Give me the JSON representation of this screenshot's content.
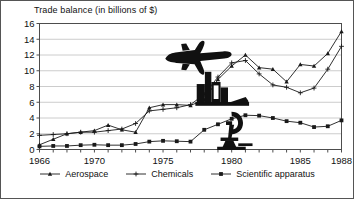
{
  "chart_data": {
    "type": "line",
    "title": "Trade balance (in billions of $)",
    "xlabel": "",
    "ylabel": "",
    "xlim": [
      1966,
      1988
    ],
    "ylim": [
      0,
      16
    ],
    "ytick_labels": [
      "0",
      "2",
      "4",
      "6",
      "8",
      "10",
      "12",
      "14",
      "16"
    ],
    "yticks": [
      0,
      2,
      4,
      6,
      8,
      10,
      12,
      14,
      16
    ],
    "xtick_labels": [
      "1966",
      "1970",
      "1975",
      "1980",
      "1985",
      "1988"
    ],
    "xticks": [
      1966,
      1970,
      1975,
      1980,
      1985,
      1988
    ],
    "grid": "horizontal",
    "legend_position": "bottom",
    "x": [
      1966,
      1967,
      1968,
      1969,
      1970,
      1971,
      1972,
      1973,
      1974,
      1975,
      1976,
      1977,
      1978,
      1979,
      1980,
      1981,
      1982,
      1983,
      1984,
      1985,
      1986,
      1987,
      1988
    ],
    "series": [
      {
        "name": "Aerospace",
        "marker": "triangle",
        "values": [
          0.6,
          1.3,
          2.0,
          2.2,
          2.4,
          3.1,
          2.5,
          2.2,
          5.3,
          5.7,
          5.7,
          5.6,
          6.3,
          8.9,
          10.6,
          12.0,
          10.4,
          10.2,
          8.6,
          10.8,
          10.6,
          12.2,
          15.0
        ]
      },
      {
        "name": "Chemicals",
        "marker": "plus",
        "values": [
          1.8,
          1.9,
          2.0,
          2.2,
          2.2,
          2.4,
          2.6,
          3.3,
          4.9,
          5.1,
          5.3,
          5.7,
          7.0,
          9.2,
          11.0,
          11.3,
          9.6,
          8.2,
          7.9,
          7.2,
          7.8,
          10.2,
          13.1
        ]
      },
      {
        "name": "Scientific apparatus",
        "marker": "square",
        "values": [
          0.4,
          0.45,
          0.45,
          0.55,
          0.6,
          0.55,
          0.55,
          0.7,
          1.0,
          1.1,
          1.05,
          1.0,
          2.5,
          3.2,
          3.9,
          4.35,
          4.3,
          4.0,
          3.6,
          3.4,
          2.85,
          2.95,
          3.7
        ]
      }
    ],
    "annotations": [
      {
        "name": "airplane-icon",
        "label": "airplane"
      },
      {
        "name": "factory-icon",
        "label": "factory"
      },
      {
        "name": "microscope-icon",
        "label": "microscope"
      }
    ]
  },
  "legend": {
    "items": [
      {
        "label": "Aerospace",
        "marker": "triangle"
      },
      {
        "label": "Chemicals",
        "marker": "plus"
      },
      {
        "label": "Scientific apparatus",
        "marker": "square"
      }
    ]
  },
  "colors": {
    "line": "#1a1a1a",
    "grid": "#bfbfbf",
    "axis": "#4d4d4d",
    "text": "#111111",
    "background": "#ffffff",
    "border": "#555555"
  }
}
